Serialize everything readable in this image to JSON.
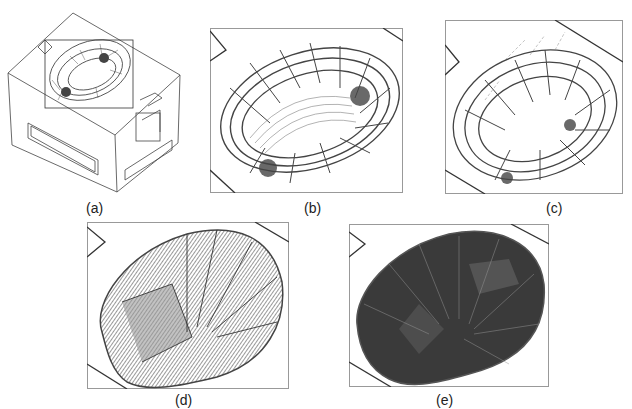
{
  "figure": {
    "panels": [
      {
        "id": "a",
        "label": "(a)",
        "description": "Isometric view of rectangular block with wireframe cavity surface and selection box"
      },
      {
        "id": "b",
        "label": "(b)",
        "description": "Zoomed wireframe of cavity surface with coarse grid and contour lines"
      },
      {
        "id": "c",
        "label": "(c)",
        "description": "Cavity wireframe with scattered tool-path vectors"
      },
      {
        "id": "d",
        "label": "(d)",
        "description": "Dense tool-path lines over cavity surface"
      },
      {
        "id": "e",
        "label": "(e)",
        "description": "Fully dense tool-path coverage of cavity surface"
      }
    ],
    "colors": {
      "line": "#333333",
      "dense": "#3a3a3a",
      "frame": "#888888"
    }
  }
}
